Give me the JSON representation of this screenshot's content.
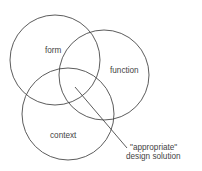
{
  "diagram": {
    "type": "venn",
    "colors": {
      "stroke": "#4a4a4a",
      "text": "#444444",
      "background": "#ffffff"
    },
    "circles": [
      {
        "id": "form",
        "label": "form",
        "cx": 55,
        "cy": 60,
        "r": 45,
        "label_x": 45,
        "label_y": 53
      },
      {
        "id": "function",
        "label": "function",
        "cx": 104,
        "cy": 75,
        "r": 45,
        "label_x": 110,
        "label_y": 73
      },
      {
        "id": "context",
        "label": "context",
        "cx": 68,
        "cy": 114,
        "r": 46,
        "label_x": 50,
        "label_y": 138
      }
    ],
    "pointer": {
      "x1": 75,
      "y1": 87,
      "x2": 127,
      "y2": 148
    },
    "annotation": {
      "line1": "\"appropriate\"",
      "line2": "design solution",
      "x": 130,
      "y1": 150,
      "y2": 159
    }
  }
}
